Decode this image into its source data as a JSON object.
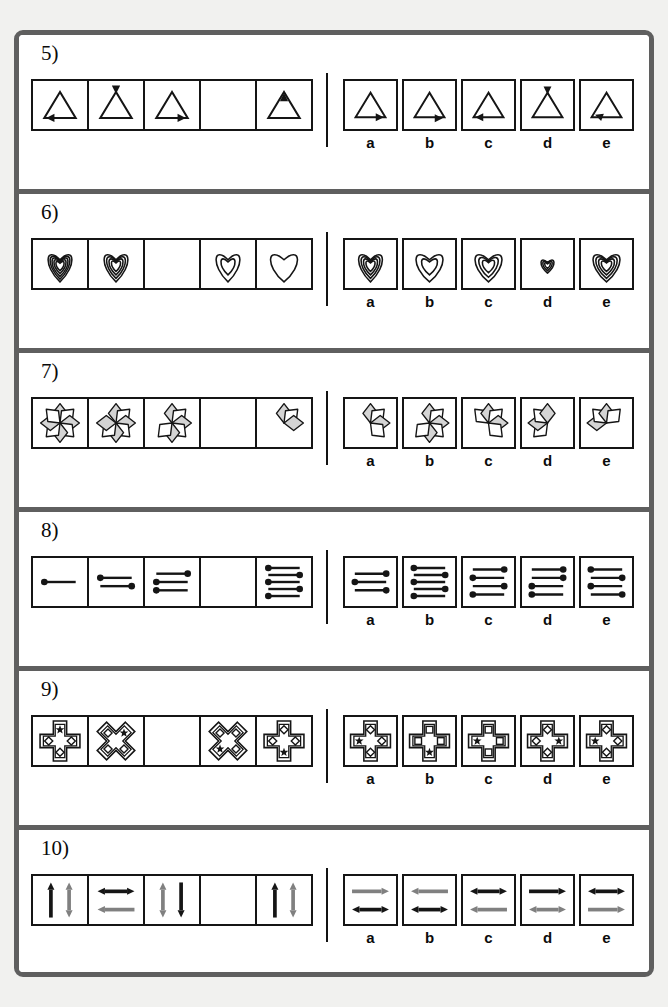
{
  "sheet": {
    "title": "Figure series reasoning worksheet",
    "page_bg": "#f1f1ef",
    "frame_color": "#5f5f5f",
    "ink_color": "#151515",
    "accent_gray": "#808080",
    "petal_fill": "#d4d4d4"
  },
  "option_labels": [
    "a",
    "b",
    "c",
    "d",
    "e"
  ],
  "problems": [
    {
      "number": "5)",
      "id": "problem-5",
      "theme": "triangle-with-arrowhead",
      "sequence": [
        {
          "kind": "triangle",
          "arrow": "bottom-left",
          "blank": false
        },
        {
          "kind": "triangle",
          "arrow": "apex-down",
          "blank": false
        },
        {
          "kind": "triangle",
          "arrow": "bottom-right",
          "blank": false
        },
        {
          "kind": "blank",
          "arrow": "",
          "blank": true
        },
        {
          "kind": "triangle",
          "arrow": "apex-up",
          "blank": false
        }
      ],
      "options": [
        {
          "label": "a",
          "kind": "triangle",
          "arrow": "bottom-right"
        },
        {
          "label": "b",
          "kind": "triangle",
          "arrow": "bottom-right-low"
        },
        {
          "label": "c",
          "kind": "triangle",
          "arrow": "bottom-left"
        },
        {
          "label": "d",
          "kind": "triangle",
          "arrow": "apex-down"
        },
        {
          "label": "e",
          "kind": "triangle",
          "arrow": "bottom-left-high"
        }
      ]
    },
    {
      "number": "6)",
      "id": "problem-6",
      "theme": "nested-hearts",
      "sequence": [
        {
          "kind": "hearts",
          "count": 5,
          "scale": 1.0,
          "narrow": true,
          "blank": false
        },
        {
          "kind": "hearts",
          "count": 4,
          "scale": 1.0,
          "narrow": true,
          "blank": false
        },
        {
          "kind": "blank",
          "count": 0,
          "scale": 1.0,
          "narrow": false,
          "blank": true
        },
        {
          "kind": "hearts",
          "count": 2,
          "scale": 1.0,
          "narrow": true,
          "blank": false
        },
        {
          "kind": "hearts",
          "count": 1,
          "scale": 1.0,
          "narrow": false,
          "blank": false
        }
      ],
      "options": [
        {
          "label": "a",
          "kind": "hearts",
          "count": 4,
          "scale": 1.0,
          "narrow": true
        },
        {
          "label": "b",
          "kind": "hearts",
          "count": 2,
          "scale": 1.0,
          "narrow": false
        },
        {
          "label": "c",
          "kind": "hearts",
          "count": 3,
          "scale": 1.0,
          "narrow": false
        },
        {
          "label": "d",
          "kind": "hearts",
          "count": 3,
          "scale": 0.48,
          "narrow": false
        },
        {
          "label": "e",
          "kind": "hearts",
          "count": 4,
          "scale": 1.0,
          "narrow": false
        }
      ]
    },
    {
      "number": "7)",
      "id": "problem-7",
      "theme": "eight-point-star-losing-petals",
      "sequence": [
        {
          "kind": "star",
          "petals": [
            0,
            1,
            2,
            3,
            4,
            5,
            6,
            7
          ],
          "blank": false
        },
        {
          "kind": "star",
          "petals": [
            0,
            1,
            2,
            3,
            4,
            5,
            6
          ],
          "blank": false
        },
        {
          "kind": "star",
          "petals": [
            0,
            1,
            2,
            3,
            4,
            5
          ],
          "blank": false
        },
        {
          "kind": "blank",
          "petals": [],
          "blank": true
        },
        {
          "kind": "star",
          "petals": [
            0,
            1,
            2
          ],
          "blank": false
        }
      ],
      "options": [
        {
          "label": "a",
          "kind": "star",
          "petals": [
            0,
            1,
            2,
            3
          ]
        },
        {
          "label": "b",
          "kind": "star",
          "petals": [
            0,
            1,
            2,
            3,
            4,
            5
          ]
        },
        {
          "label": "c",
          "kind": "star",
          "petals": [
            7,
            0,
            1,
            2,
            3
          ]
        },
        {
          "label": "d",
          "kind": "star",
          "petals": [
            5,
            6,
            7,
            0
          ]
        },
        {
          "label": "e",
          "kind": "star",
          "petals": [
            6,
            7,
            0,
            1
          ]
        }
      ]
    },
    {
      "number": "8)",
      "id": "problem-8",
      "theme": "dotted-lines-increasing",
      "sequence": [
        {
          "kind": "lines",
          "dots": [
            "L"
          ],
          "blank": false
        },
        {
          "kind": "lines",
          "dots": [
            "L",
            "R"
          ],
          "blank": false
        },
        {
          "kind": "lines",
          "dots": [
            "R",
            "L",
            "L"
          ],
          "blank": false
        },
        {
          "kind": "blank",
          "dots": [],
          "blank": true
        },
        {
          "kind": "lines",
          "dots": [
            "L",
            "R",
            "L",
            "R",
            "L"
          ],
          "blank": false
        }
      ],
      "options": [
        {
          "label": "a",
          "kind": "lines",
          "dots": [
            "R",
            "L",
            "R"
          ]
        },
        {
          "label": "b",
          "kind": "lines",
          "dots": [
            "L",
            "R",
            "L",
            "R",
            "L"
          ]
        },
        {
          "label": "c",
          "kind": "lines",
          "dots": [
            "R",
            "L",
            "R",
            "L"
          ]
        },
        {
          "label": "d",
          "kind": "lines",
          "dots": [
            "R",
            "R",
            "L",
            "L"
          ]
        },
        {
          "label": "e",
          "kind": "lines",
          "dots": [
            "L",
            "R",
            "L",
            "R"
          ]
        }
      ]
    },
    {
      "number": "9)",
      "id": "problem-9",
      "theme": "cross-with-star-marker",
      "sequence": [
        {
          "kind": "cross",
          "rotation": 0,
          "star": "top",
          "blank": false
        },
        {
          "kind": "cross",
          "rotation": 45,
          "star": "top",
          "blank": false
        },
        {
          "kind": "blank",
          "rotation": 0,
          "star": "",
          "blank": true
        },
        {
          "kind": "cross",
          "rotation": 45,
          "star": "bottom",
          "blank": false
        },
        {
          "kind": "cross",
          "rotation": 0,
          "star": "bottom",
          "blank": false
        }
      ],
      "options": [
        {
          "label": "a",
          "kind": "cross",
          "rotation": 0,
          "star": "left",
          "marker": "diamond"
        },
        {
          "label": "b",
          "kind": "cross",
          "rotation": 0,
          "star": "bottom",
          "marker": "square"
        },
        {
          "label": "c",
          "kind": "cross",
          "rotation": 0,
          "star": "left",
          "marker": "square"
        },
        {
          "label": "d",
          "kind": "cross",
          "rotation": 0,
          "star": "right",
          "marker": "diamond"
        },
        {
          "label": "e",
          "kind": "cross",
          "rotation": 0,
          "star": "left",
          "marker": "diamond"
        }
      ]
    },
    {
      "number": "10)",
      "id": "problem-10",
      "theme": "paired-arrows",
      "sequence": [
        {
          "kind": "arrows",
          "top": {
            "dir": "up",
            "color": "black"
          },
          "bottom": {
            "dir": "updown",
            "color": "gray"
          },
          "layout": "side",
          "blank": false
        },
        {
          "kind": "arrows",
          "top": {
            "dir": "leftright",
            "color": "black"
          },
          "bottom": {
            "dir": "left",
            "color": "gray"
          },
          "layout": "stack",
          "blank": false
        },
        {
          "kind": "arrows",
          "top": {
            "dir": "updown",
            "color": "gray"
          },
          "bottom": {
            "dir": "down",
            "color": "black"
          },
          "layout": "side",
          "blank": false
        },
        {
          "kind": "blank",
          "top": {},
          "bottom": {},
          "layout": "",
          "blank": true
        },
        {
          "kind": "arrows",
          "top": {
            "dir": "up",
            "color": "black"
          },
          "bottom": {
            "dir": "updown",
            "color": "gray"
          },
          "layout": "side",
          "blank": false
        }
      ],
      "options": [
        {
          "label": "a",
          "kind": "arrows",
          "top": {
            "dir": "right",
            "color": "gray"
          },
          "bottom": {
            "dir": "leftright",
            "color": "black"
          },
          "layout": "stack"
        },
        {
          "label": "b",
          "kind": "arrows",
          "top": {
            "dir": "left",
            "color": "gray"
          },
          "bottom": {
            "dir": "leftright",
            "color": "black"
          },
          "layout": "stack"
        },
        {
          "label": "c",
          "kind": "arrows",
          "top": {
            "dir": "leftright",
            "color": "black"
          },
          "bottom": {
            "dir": "left",
            "color": "gray"
          },
          "layout": "stack"
        },
        {
          "label": "d",
          "kind": "arrows",
          "top": {
            "dir": "right",
            "color": "black"
          },
          "bottom": {
            "dir": "leftright",
            "color": "gray"
          },
          "layout": "stack"
        },
        {
          "label": "e",
          "kind": "arrows",
          "top": {
            "dir": "leftright",
            "color": "black"
          },
          "bottom": {
            "dir": "right",
            "color": "gray"
          },
          "layout": "stack"
        }
      ]
    }
  ]
}
